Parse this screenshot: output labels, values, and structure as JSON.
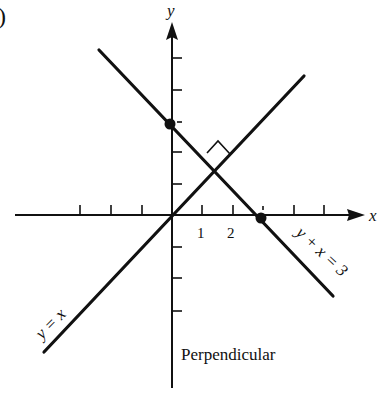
{
  "figure_label": ")",
  "axes": {
    "x_label": "x",
    "y_label": "y",
    "x_ticks": [
      "1",
      "2"
    ]
  },
  "lines": [
    {
      "name": "y-equals-x",
      "label": "y = x"
    },
    {
      "name": "y-plus-x-equals-3",
      "label": "y + x = 3"
    }
  ],
  "caption": "Perpendicular",
  "colors": {
    "ink": "#111111",
    "background": "#ffffff"
  }
}
